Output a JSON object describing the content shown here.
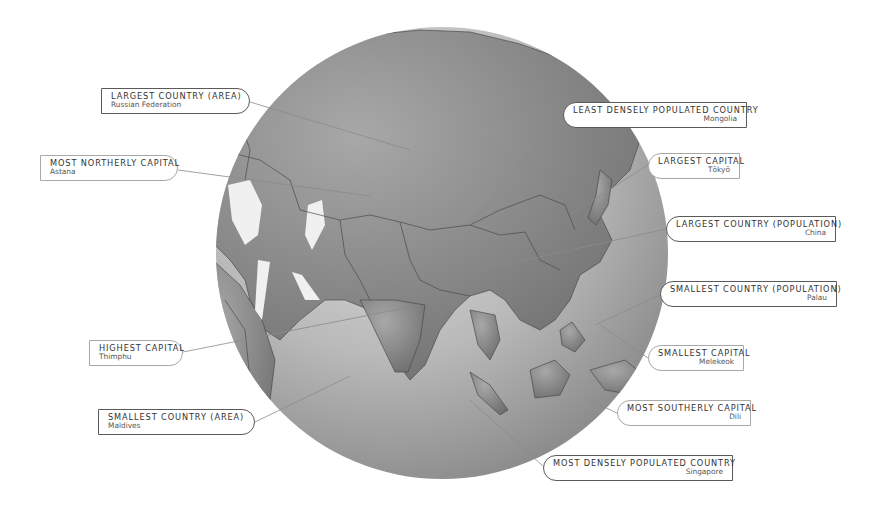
{
  "figure": {
    "colors": {
      "ocean_light": "#d4d4d4",
      "ocean_dark": "#8c8c8c",
      "land": "#8f8f8f",
      "ice_lake": "#f0f0f0",
      "border_line": "#4a4a4a",
      "leader_line": "#8a8a8a",
      "callout_border_strong": "#5a5a5a",
      "callout_border_light": "#a8a8a8"
    }
  },
  "callouts": [
    {
      "id": "largest-country-area",
      "title": "LARGEST COUNTRY (AREA)",
      "value": "Russian Federation",
      "side": "left",
      "style": "strong"
    },
    {
      "id": "most-northerly-capital",
      "title": "MOST NORTHERLY CAPITAL",
      "value": "Astana",
      "side": "left",
      "style": "light"
    },
    {
      "id": "highest-capital",
      "title": "HIGHEST CAPITAL",
      "value": "Thimphu",
      "side": "left",
      "style": "light"
    },
    {
      "id": "smallest-country-area",
      "title": "SMALLEST COUNTRY (AREA)",
      "value": "Maldives",
      "side": "left",
      "style": "strong"
    },
    {
      "id": "least-densely-populated",
      "title": "LEAST DENSELY POPULATED COUNTRY",
      "value": "Mongolia",
      "side": "right",
      "style": "strong"
    },
    {
      "id": "largest-capital",
      "title": "LARGEST CAPITAL",
      "value": "Tōkyō",
      "side": "right",
      "style": "light"
    },
    {
      "id": "largest-country-population",
      "title": "LARGEST COUNTRY (POPULATION)",
      "value": "China",
      "side": "right",
      "style": "strong"
    },
    {
      "id": "smallest-country-population",
      "title": "SMALLEST COUNTRY (POPULATION)",
      "value": "Palau",
      "side": "right",
      "style": "strong"
    },
    {
      "id": "smallest-capital",
      "title": "SMALLEST CAPITAL",
      "value": "Melekeok",
      "side": "right",
      "style": "light"
    },
    {
      "id": "most-southerly-capital",
      "title": "MOST SOUTHERLY CAPITAL",
      "value": "Dili",
      "side": "right",
      "style": "light"
    },
    {
      "id": "most-densely-populated",
      "title": "MOST DENSELY POPULATED COUNTRY",
      "value": "Singapore",
      "side": "right",
      "style": "strong"
    }
  ]
}
